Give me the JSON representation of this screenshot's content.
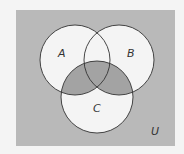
{
  "diagram": {
    "type": "venn",
    "universe_label": "U",
    "sets": [
      {
        "label": "A",
        "cx": 75,
        "cy": 60,
        "r": 35
      },
      {
        "label": "B",
        "cx": 119,
        "cy": 60,
        "r": 35
      },
      {
        "label": "C",
        "cx": 97,
        "cy": 97,
        "r": 36
      }
    ],
    "shaded_region": "U − (A ∪ B ∪ C) and C ∩ (A ∪ B)",
    "colors": {
      "page": "#f4f4f4",
      "universe_fill": "#b9b9b9",
      "circle_fill": "#f4f4f4",
      "shaded_fill": "#a3a3a3",
      "stroke": "#333333"
    }
  }
}
